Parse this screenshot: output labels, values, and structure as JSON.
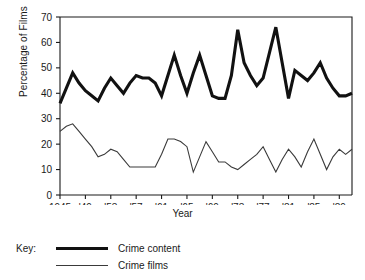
{
  "chart_data": {
    "type": "line",
    "title": "",
    "xlabel": "Year",
    "ylabel": "Percentage of Films",
    "ylim": [
      0,
      70
    ],
    "yticks": [
      0,
      10,
      20,
      30,
      40,
      50,
      60,
      70
    ],
    "xlim": [
      1945,
      1991
    ],
    "xticks": [
      1945,
      1949,
      1953,
      1957,
      1961,
      1965,
      1969,
      1973,
      1977,
      1981,
      1985,
      1989
    ],
    "xticklabels": [
      "1945",
      "'49",
      "'53",
      "'57",
      "'61",
      "'65",
      "'69",
      "'73",
      "'77",
      "'81",
      "'85",
      "'89"
    ],
    "grid": false,
    "legend_position": "below-left",
    "legend_title": "Key:",
    "x": [
      1945,
      1946,
      1947,
      1948,
      1949,
      1950,
      1951,
      1952,
      1953,
      1954,
      1955,
      1956,
      1957,
      1958,
      1959,
      1960,
      1961,
      1962,
      1963,
      1964,
      1965,
      1966,
      1967,
      1968,
      1969,
      1970,
      1971,
      1972,
      1973,
      1974,
      1975,
      1976,
      1977,
      1978,
      1979,
      1980,
      1981,
      1982,
      1983,
      1984,
      1985,
      1986,
      1987,
      1988,
      1989,
      1990,
      1991
    ],
    "series": [
      {
        "name": "Crime content",
        "style": "thick",
        "color": "#111111",
        "values": [
          36,
          42,
          48,
          44,
          41,
          39,
          37,
          42,
          46,
          43,
          40,
          44,
          47,
          46,
          46,
          44,
          39,
          47,
          55,
          47,
          40,
          48,
          55,
          47,
          39,
          38,
          38,
          47,
          65,
          52,
          47,
          43,
          46,
          56,
          66,
          52,
          38,
          49,
          47,
          45,
          48,
          52,
          46,
          42,
          39,
          39,
          40
        ]
      },
      {
        "name": "Crime films",
        "style": "thin",
        "color": "#3a3a3a",
        "values": [
          25,
          27,
          28,
          25,
          22,
          19,
          15,
          16,
          18,
          17,
          14,
          11,
          11,
          11,
          11,
          11,
          16,
          22,
          22,
          21,
          19,
          9,
          15,
          21,
          17,
          13,
          13,
          11,
          10,
          12,
          14,
          16,
          19,
          14,
          9,
          14,
          18,
          15,
          11,
          17,
          22,
          16,
          10,
          15,
          18,
          16,
          18
        ]
      }
    ]
  },
  "legend": {
    "title": "Key:",
    "entries": [
      {
        "label": "Crime content",
        "style": "thick"
      },
      {
        "label": "Crime films",
        "style": "thin"
      }
    ]
  }
}
